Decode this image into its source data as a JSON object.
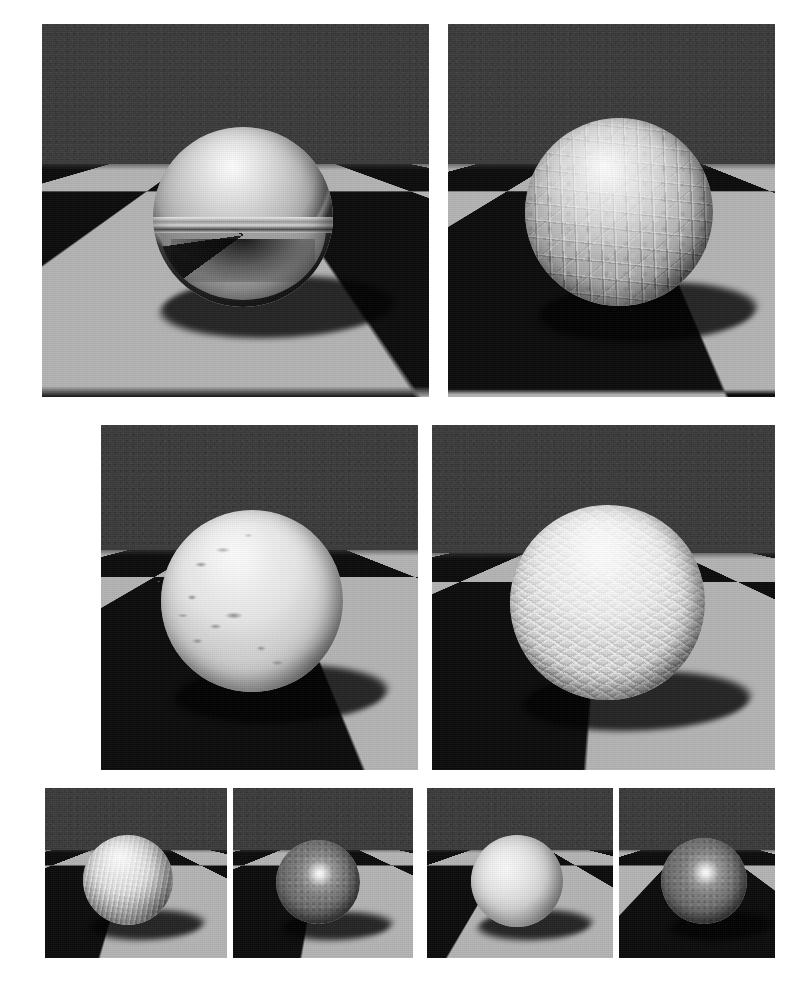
{
  "figure": {
    "kind": "rendered-image-grid",
    "title": "",
    "caption": "",
    "background_color": "#ffffff",
    "rows": 3,
    "panel_count": 8,
    "shared_scene": {
      "description": "sphere resting on an infinite checkerboard plane in front of a dark gray backdrop",
      "backdrop_color": "#3b3b3b",
      "floor_light_tile_color": "#b4b4b4",
      "floor_dark_tile_color": "#0b0b0b",
      "shadow_color": "#000000",
      "shadow_direction": "down-right",
      "camera": "low, near floor level, sphere centered"
    },
    "panel_groups": [
      {
        "group_name": "row-1-large",
        "panels": [
          {
            "id": "panel-1",
            "material_label": "mirror",
            "surface": "polished chrome / perfect mirror",
            "sphere_tone": "#a8a8a8",
            "reflects_floor": "true",
            "bump": "none"
          },
          {
            "id": "panel-2",
            "material_label": "crackle",
            "surface": "cracked crackle bump map",
            "sphere_tone": "#9c9c9c",
            "reflects_floor": "false",
            "bump": "high"
          }
        ]
      },
      {
        "group_name": "row-2-large",
        "panels": [
          {
            "id": "panel-3",
            "material_label": "dents",
            "surface": "sparse dents / gouges bump map",
            "sphere_tone": "#d8d8d8",
            "reflects_floor": "false",
            "bump": "low"
          },
          {
            "id": "panel-4",
            "material_label": "tread",
            "surface": "diamond-plate tread bump map",
            "sphere_tone": "#dedede",
            "reflects_floor": "false",
            "bump": "medium"
          }
        ]
      },
      {
        "group_name": "row-3-small",
        "panels": [
          {
            "id": "panel-5",
            "material_label": "ribbed",
            "surface": "ribbed corduroy wave bump map",
            "sphere_tone": "#cfcfcf",
            "reflects_floor": "false",
            "bump": "medium"
          },
          {
            "id": "panel-6",
            "material_label": "glossy-dark",
            "surface": "glossy specular, dark body",
            "sphere_tone": "#6d6d6d",
            "reflects_floor": "false",
            "bump": "none"
          },
          {
            "id": "panel-7",
            "material_label": "matte",
            "surface": "smooth matte diffuse",
            "sphere_tone": "#d4d4d4",
            "reflects_floor": "false",
            "bump": "none"
          },
          {
            "id": "panel-8",
            "material_label": "glossy-dark-2",
            "surface": "glossy specular, dark body",
            "sphere_tone": "#6d6d6d",
            "reflects_floor": "false",
            "bump": "none"
          }
        ]
      }
    ]
  }
}
